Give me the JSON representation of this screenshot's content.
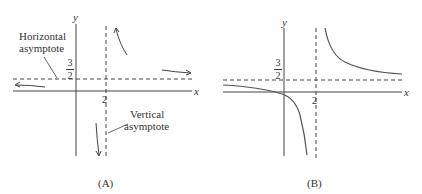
{
  "panelA": {
    "caption": "(A)",
    "x_label": "x",
    "y_label": "y",
    "ha_value_num": "3",
    "ha_value_den": "2",
    "va_value": "2",
    "ha_annotation": [
      "Horizontal",
      "asymptote"
    ],
    "va_annotation": [
      "Vertical",
      "asymptote"
    ]
  },
  "panelB": {
    "caption": "(B)",
    "x_label": "x",
    "y_label": "y",
    "ha_value_num": "3",
    "ha_value_den": "2",
    "va_value": "2"
  },
  "colors": {
    "line": "#444444",
    "curve": "#555555"
  }
}
